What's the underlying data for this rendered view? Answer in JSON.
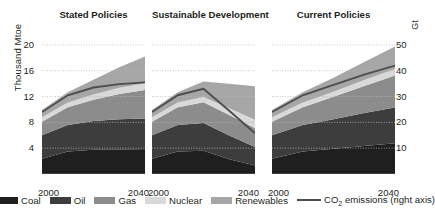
{
  "axes": {
    "left_title": "Thousand Mtoe",
    "right_title": "Gt",
    "left_ticks": [
      "20",
      "16",
      "12",
      "8",
      "4"
    ],
    "right_ticks": [
      "50",
      "40",
      "30",
      "20",
      "10"
    ],
    "x_start": "2000",
    "x_end": "2040"
  },
  "legend": {
    "items": [
      {
        "label": "Coal",
        "color": "#1f1f1f",
        "kind": "area"
      },
      {
        "label": "Oil",
        "color": "#3d3d3d",
        "kind": "area"
      },
      {
        "label": "Gas",
        "color": "#8c8c8c",
        "kind": "area"
      },
      {
        "label": "Nuclear",
        "color": "#d9d9d9",
        "kind": "area"
      },
      {
        "label": "Renewables",
        "color": "#a6a6a6",
        "kind": "area"
      },
      {
        "label": "CO2 emissions (right axis)",
        "color": "#4d4d4d",
        "kind": "line"
      }
    ],
    "co2_prefix": "CO",
    "co2_sub": "2",
    "co2_suffix": " emissions (right axis)"
  },
  "chart_data": {
    "type": "area",
    "xlabel": "",
    "ylabel": "Thousand Mtoe",
    "y2label": "Gt",
    "ylim": [
      0,
      22
    ],
    "y2lim": [
      0,
      55
    ],
    "yticks": [
      4,
      8,
      12,
      16,
      20
    ],
    "y2ticks": [
      10,
      20,
      30,
      40,
      50
    ],
    "grid": "dotted-horizontal",
    "legend_position": "bottom",
    "x": [
      2000,
      2010,
      2020,
      2030,
      2040
    ],
    "panels": [
      {
        "title": "Stated Policies",
        "series": [
          {
            "name": "Coal",
            "values": [
              2.35,
              3.5,
              3.75,
              3.75,
              3.7
            ]
          },
          {
            "name": "Oil",
            "values": [
              3.65,
              4.1,
              4.45,
              4.75,
              4.9
            ]
          },
          {
            "name": "Gas",
            "values": [
              2.1,
              2.75,
              3.3,
              3.9,
              4.4
            ]
          },
          {
            "name": "Nuclear",
            "values": [
              0.68,
              0.72,
              0.8,
              0.95,
              1.05
            ]
          },
          {
            "name": "Renewables",
            "values": [
              1.15,
              1.6,
              2.3,
              3.2,
              4.15
            ]
          }
        ],
        "total": [
          9.9,
          12.7,
          14.6,
          16.6,
          18.2
        ],
        "co2_emissions": {
          "name": "CO2 emissions (right axis)",
          "values": [
            24.0,
            30.5,
            33.5,
            34.8,
            35.5
          ]
        }
      },
      {
        "title": "Sustainable Development",
        "series": [
          {
            "name": "Coal",
            "values": [
              2.35,
              3.5,
              3.6,
              2.3,
              1.3
            ]
          },
          {
            "name": "Oil",
            "values": [
              3.65,
              4.1,
              4.3,
              3.65,
              2.9
            ]
          },
          {
            "name": "Gas",
            "values": [
              2.1,
              2.75,
              3.2,
              3.2,
              2.9
            ]
          },
          {
            "name": "Nuclear",
            "values": [
              0.68,
              0.72,
              0.82,
              1.05,
              1.3
            ]
          },
          {
            "name": "Renewables",
            "values": [
              1.15,
              1.6,
              2.4,
              3.8,
              5.2
            ]
          }
        ],
        "total": [
          9.9,
          12.7,
          14.3,
          14.0,
          13.6
        ],
        "co2_emissions": {
          "name": "CO2 emissions (right axis)",
          "values": [
            24.0,
            30.5,
            33.0,
            24.5,
            15.8
          ]
        }
      },
      {
        "title": "Current Policies",
        "series": [
          {
            "name": "Coal",
            "values": [
              2.35,
              3.5,
              3.9,
              4.35,
              4.75
            ]
          },
          {
            "name": "Oil",
            "values": [
              3.65,
              4.1,
              4.6,
              5.1,
              5.55
            ]
          },
          {
            "name": "Gas",
            "values": [
              2.1,
              2.75,
              3.45,
              4.2,
              4.95
            ]
          },
          {
            "name": "Nuclear",
            "values": [
              0.68,
              0.72,
              0.8,
              0.92,
              1.0
            ]
          },
          {
            "name": "Renewables",
            "values": [
              1.15,
              1.6,
              2.15,
              2.8,
              3.5
            ]
          }
        ],
        "total": [
          9.9,
          12.7,
          14.9,
          17.4,
          19.8
        ],
        "co2_emissions": {
          "name": "CO2 emissions (right axis)",
          "values": [
            24.0,
            30.5,
            34.5,
            38.5,
            42.0
          ]
        }
      }
    ]
  }
}
